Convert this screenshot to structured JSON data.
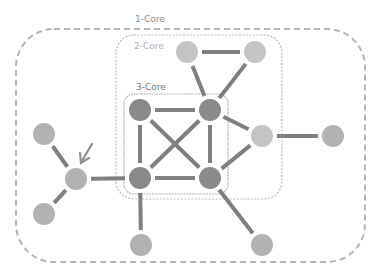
{
  "labels": {
    "core1": "1-Core",
    "core2": "2-Core",
    "core3": "3-Core"
  },
  "colors": {
    "core1_border": "#b4b4b4",
    "core2_border": "#b9b9b9",
    "core3_border": "#a6a6a6",
    "label_core1": "#8c8c8c",
    "label_core2": "#b0b0b0",
    "label_core3": "#7a7a7a",
    "edge": "#7f7f7f",
    "node_core3": "#8a8a8a",
    "node_outer": "#b2b2b2",
    "node_core2": "#c4c4c4",
    "arrow": "#8f8f8f"
  },
  "nodes": [
    {
      "id": "n2a",
      "core": 2,
      "x": 187,
      "y": 52
    },
    {
      "id": "n2b",
      "core": 2,
      "x": 255,
      "y": 52
    },
    {
      "id": "n3a",
      "core": 3,
      "x": 140,
      "y": 110
    },
    {
      "id": "n3b",
      "core": 3,
      "x": 210,
      "y": 110
    },
    {
      "id": "n3c",
      "core": 3,
      "x": 140,
      "y": 178
    },
    {
      "id": "n3d",
      "core": 3,
      "x": 210,
      "y": 178
    },
    {
      "id": "n2c",
      "core": 2,
      "x": 262,
      "y": 136
    },
    {
      "id": "n1a",
      "core": 1,
      "x": 333,
      "y": 136
    },
    {
      "id": "n1hub",
      "core": 1,
      "x": 76,
      "y": 179
    },
    {
      "id": "n1b",
      "core": 1,
      "x": 44,
      "y": 134
    },
    {
      "id": "n1c",
      "core": 1,
      "x": 44,
      "y": 214
    },
    {
      "id": "n1d",
      "core": 1,
      "x": 141,
      "y": 245
    },
    {
      "id": "n1e",
      "core": 1,
      "x": 262,
      "y": 245
    }
  ],
  "edges": [
    [
      "n2a",
      "n2b"
    ],
    [
      "n2a",
      "n3b"
    ],
    [
      "n2b",
      "n3b"
    ],
    [
      "n3a",
      "n3b"
    ],
    [
      "n3a",
      "n3c"
    ],
    [
      "n3a",
      "n3d"
    ],
    [
      "n3b",
      "n3c"
    ],
    [
      "n3b",
      "n3d"
    ],
    [
      "n3c",
      "n3d"
    ],
    [
      "n3b",
      "n2c"
    ],
    [
      "n3d",
      "n2c"
    ],
    [
      "n2c",
      "n1a"
    ],
    [
      "n1hub",
      "n3c"
    ],
    [
      "n1hub",
      "n1b"
    ],
    [
      "n1hub",
      "n1c"
    ],
    [
      "n3c",
      "n1d"
    ],
    [
      "n3d",
      "n1e"
    ]
  ]
}
